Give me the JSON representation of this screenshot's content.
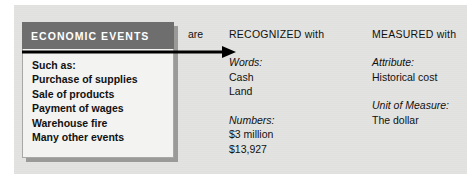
{
  "figure": {
    "background_color": "#ffffff",
    "panel_color": "#e3e3e1"
  },
  "events_box": {
    "header_label": "ECONOMIC EVENTS",
    "header_color": "#6e6e6e",
    "header_text_color": "#ffffff",
    "body_color": "#f3f3f1",
    "items": [
      "Such as:",
      "Purchase of supplies",
      "Sale of products",
      "Payment of wages",
      "Warehouse fire",
      "Many other events"
    ]
  },
  "connector": {
    "label": "are",
    "arrow_icon": "right-arrow-icon",
    "color": "#000000"
  },
  "columns": [
    {
      "id": "recognized",
      "title": "RECOGNIZED with",
      "groups": [
        {
          "label": "Words:",
          "items": [
            "Cash",
            "Land"
          ]
        },
        {
          "label": "Numbers:",
          "items": [
            "$3 million",
            "$13,927"
          ]
        }
      ]
    },
    {
      "id": "measured",
      "title": "MEASURED with",
      "groups": [
        {
          "label": "Attribute:",
          "items": [
            "Historical cost"
          ]
        },
        {
          "label": "Unit of Measure:",
          "items": [
            "The dollar"
          ]
        }
      ]
    }
  ]
}
